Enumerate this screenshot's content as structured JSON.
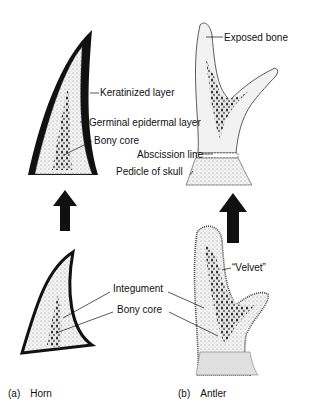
{
  "figure": {
    "panels": [
      {
        "id": "a",
        "caption_tag": "(a)",
        "caption_title": "Horn",
        "adult_labels": [
          "Keratinized layer",
          "Germinal epidermal layer",
          "Bony core"
        ],
        "young_labels": [
          "Integument",
          "Bony core"
        ]
      },
      {
        "id": "b",
        "caption_tag": "(b)",
        "caption_title": "Antler",
        "adult_labels": [
          "Exposed bone",
          "Abscission line",
          "Pedicle of skull"
        ],
        "young_labels": [
          "“Velvet”"
        ]
      }
    ],
    "arrows": [
      "growth-arrow-horn",
      "growth-arrow-antler"
    ],
    "colors": {
      "ink": "#111111",
      "background": "#ffffff",
      "tissue": "#e8e8e8"
    }
  }
}
